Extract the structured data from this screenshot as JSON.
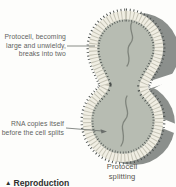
{
  "diagram": {
    "type": "biology-textbook-figure",
    "labels": {
      "protocell_label": {
        "line1": "Protocell, becoming",
        "line2": "large and unwieldy,",
        "line3": "breaks into two"
      },
      "rna_label": {
        "line1": "RNA copies itself",
        "line2": "before the cell splits"
      },
      "caption": {
        "line1": "Protocell",
        "line2": "splitting"
      },
      "section_heading": {
        "bullet": "▲",
        "text": "Reproduction"
      }
    },
    "shapes": {
      "main_cell": "figure-eight (peanut) protocell with lipid membrane shown as stippled edges and radial tick band",
      "shadow_cell": "dark gray offset silhouette of two overlapping circles behind the cell, crossed by two white diagonal gaps",
      "rna_strands": "one wavy strand inside each lobe"
    },
    "colors": {
      "background": "#fdfdfb",
      "shadow": "#8b8f8c",
      "membrane_dots": "#4a4f4c",
      "membrane_band": "#f0eee3",
      "membrane_ticks": "#c6c4b6",
      "cell_interior": "#b7bcb2",
      "rna_strand": "#7f847c",
      "label_text": "#5f6361",
      "leader_line": "#6a6e6b",
      "heading_text": "#2f2f2d"
    }
  }
}
